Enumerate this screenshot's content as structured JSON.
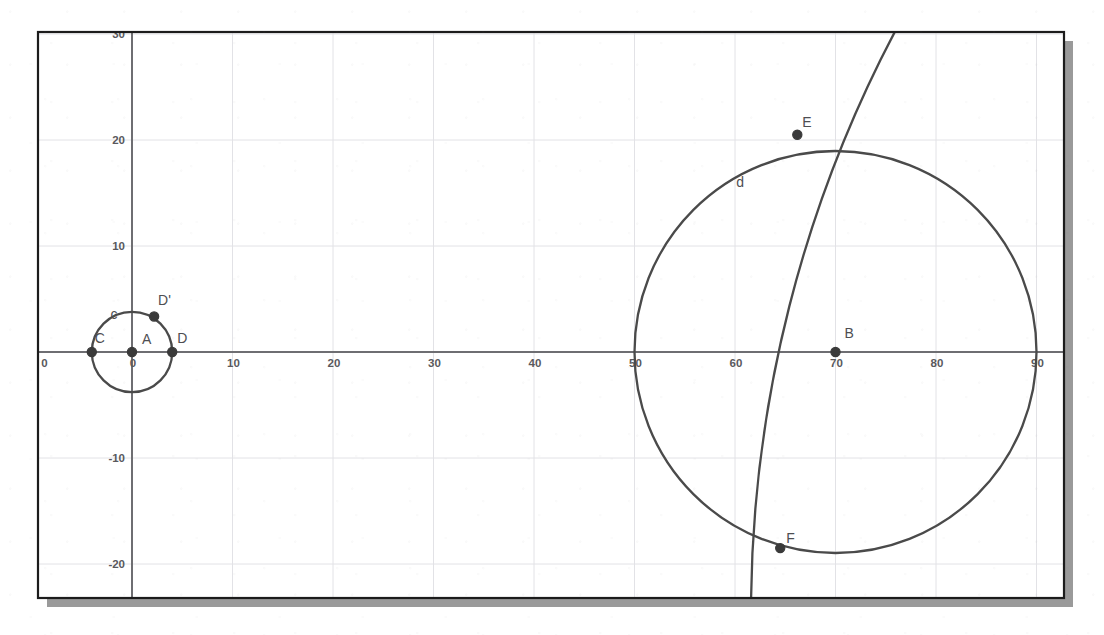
{
  "figure": {
    "kind": "coordinate-geometry-diagram",
    "frame": {
      "x": 38,
      "y": 32,
      "width": 1026,
      "height": 566
    },
    "shadow_offset": {
      "x": 9,
      "y": 9
    },
    "colors": {
      "background": "#ffffff",
      "frame_border": "#1c1c1c",
      "shadow": "#9a9a9a",
      "grid_minor": "#e2e2e6",
      "grid_major": "#d0d0d6",
      "axis": "#6e6e72",
      "curve": "#4a4a4a",
      "point": "#3a3a3a",
      "label_text": "#4e4e52",
      "tick_text": "#59595d"
    }
  },
  "axes": {
    "origin_px": {
      "x": 132,
      "y": 352
    },
    "x_scale_px_per_unit": 10.05,
    "y_scale_px_per_unit": 10.6,
    "x_range": [
      -9.4,
      93.2
    ],
    "y_range": [
      -23.2,
      30.2
    ],
    "grid_step": 10,
    "grid_visible": true,
    "x_axis_ticks": [
      {
        "label": "0",
        "value": 0
      },
      {
        "label": "10",
        "value": 10
      },
      {
        "label": "20",
        "value": 20
      },
      {
        "label": "30",
        "value": 30
      },
      {
        "label": "40",
        "value": 40
      },
      {
        "label": "50",
        "value": 50
      },
      {
        "label": "60",
        "value": 60
      },
      {
        "label": "70",
        "value": 70
      },
      {
        "label": "80",
        "value": 80
      },
      {
        "label": "90",
        "value": 90
      }
    ],
    "x_edge_tick": {
      "label": "0",
      "value": -9
    },
    "y_axis_ticks": [
      {
        "label": "30",
        "value": 30
      },
      {
        "label": "20",
        "value": 20
      },
      {
        "label": "10",
        "value": 10
      },
      {
        "label": "-10",
        "value": -10
      },
      {
        "label": "-20",
        "value": -20
      }
    ]
  },
  "chart_data": {
    "type": "scatter",
    "title": "",
    "xlabel": "",
    "ylabel": "",
    "xlim": [
      -9.4,
      93.2
    ],
    "ylim": [
      -23.2,
      30.2
    ],
    "grid": true,
    "legend": "none",
    "circles": [
      {
        "name": "c",
        "label": "c",
        "label_position": {
          "x": -1.8,
          "y": 3.1
        },
        "center": {
          "x": 0,
          "y": 0
        },
        "center_point": "A",
        "radius": 4.0
      },
      {
        "name": "d",
        "label": "d",
        "label_position": {
          "x": 60.5,
          "y": 15.6
        },
        "center": {
          "x": 70,
          "y": 0
        },
        "center_point": "B",
        "radius": 20.0
      }
    ],
    "arcs": [
      {
        "name": "arc-through-E-F",
        "description": "large-radius arc crossing circle d at E and F, entering the top border and exiting the bottom border",
        "through": [
          "E",
          "F"
        ],
        "top_endpoint": {
          "x": 75.9,
          "y": 30.2
        },
        "bottom_endpoint": {
          "x": 61.6,
          "y": -23.2
        },
        "approx_center": {
          "x": 190,
          "y": 2
        },
        "approx_radius": 124
      }
    ],
    "points": [
      {
        "name": "A",
        "label": "A",
        "x": 0,
        "y": 0,
        "label_dx": 10,
        "label_dy": -8,
        "filled": true
      },
      {
        "name": "B",
        "label": "B",
        "x": 70,
        "y": 0,
        "label_dx": 9,
        "label_dy": -14,
        "filled": true
      },
      {
        "name": "C",
        "label": "C",
        "x": -4,
        "y": 0,
        "label_dx": 3,
        "label_dy": -9,
        "filled": true
      },
      {
        "name": "D",
        "label": "D",
        "x": 4,
        "y": 0,
        "label_dx": 5,
        "label_dy": -9,
        "filled": true
      },
      {
        "name": "D'",
        "label": "D'",
        "x": 2.2,
        "y": 3.35,
        "label_dx": 4,
        "label_dy": -11,
        "filled": true
      },
      {
        "name": "E",
        "label": "E",
        "x": 66.2,
        "y": 20.5,
        "label_dx": 5,
        "label_dy": -8,
        "filled": true
      },
      {
        "name": "F",
        "label": "F",
        "x": 64.5,
        "y": -18.5,
        "label_dx": 6,
        "label_dy": -5,
        "filled": true
      }
    ]
  }
}
